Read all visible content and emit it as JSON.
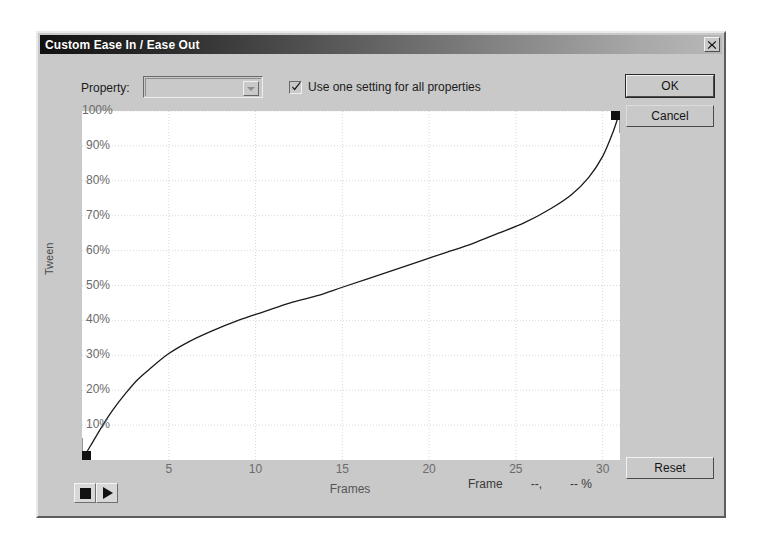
{
  "window": {
    "title": "Custom Ease In / Ease Out",
    "close_icon": "close-x-icon"
  },
  "controls": {
    "property_label": "Property:",
    "property_value": "",
    "property_placeholder": "",
    "use_one_setting_label": "Use one setting for all properties",
    "use_one_setting_checked": true,
    "ok_label": "OK",
    "cancel_label": "Cancel",
    "reset_label": "Reset"
  },
  "transport": {
    "stop_label": "stop-icon",
    "play_label": "play-icon"
  },
  "status": {
    "frame_label": "Frame",
    "frame_value": "--,",
    "percent_value": "-- %"
  },
  "chart_data": {
    "type": "line",
    "title": "",
    "xlabel": "Frames",
    "ylabel": "Tween",
    "xlim": [
      0,
      31
    ],
    "ylim": [
      0,
      100
    ],
    "grid": true,
    "legend": "none",
    "x_ticks": [
      5,
      10,
      15,
      20,
      25,
      30
    ],
    "x_tick_labels": [
      "5",
      "10",
      "15",
      "20",
      "25",
      "30"
    ],
    "y_ticks": [
      10,
      20,
      30,
      40,
      50,
      60,
      70,
      80,
      90,
      100
    ],
    "y_tick_labels": [
      "10%",
      "20%",
      "30%",
      "40%",
      "50%",
      "60%",
      "70%",
      "80%",
      "90%",
      "100%"
    ],
    "series": [
      {
        "name": "Custom ease curve",
        "color": "#1a1a1a",
        "control_points": [
          {
            "frame": 0,
            "tween": 0,
            "type": "square-handle"
          },
          {
            "frame": 31,
            "tween": 100,
            "type": "square-handle"
          }
        ],
        "x": [
          0,
          0.6,
          1.2,
          1.8,
          2.5,
          3.2,
          4.0,
          5.0,
          6.2,
          7.5,
          9.0,
          10.5,
          12.0,
          13.5,
          15.0,
          16.5,
          18.0,
          19.5,
          21.0,
          22.5,
          24.0,
          25.5,
          27.0,
          28.2,
          29.2,
          30.0,
          30.6,
          31.0
        ],
        "y": [
          0,
          5,
          10,
          14.5,
          19,
          23,
          26.5,
          30.5,
          34,
          37,
          40,
          42.5,
          45,
          47,
          49.5,
          52,
          54.5,
          57,
          59.5,
          62,
          65,
          68,
          72,
          76,
          81,
          87,
          94,
          100
        ]
      }
    ]
  }
}
